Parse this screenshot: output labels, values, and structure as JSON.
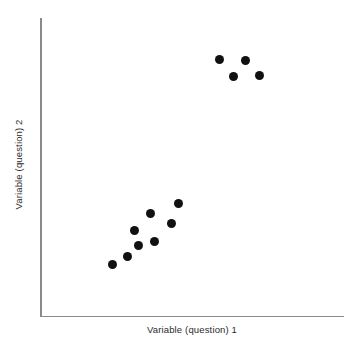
{
  "chart_data": {
    "type": "scatter",
    "title": "",
    "subtitle": "",
    "xlabel": "Variable (question) 1",
    "ylabel": "Variable (question) 2",
    "xlim": [
      0,
      100
    ],
    "ylim": [
      0,
      100
    ],
    "grid": false,
    "legend": null,
    "tick_labels": {
      "x": [],
      "y": []
    },
    "marker": {
      "shape": "circle",
      "color": "#111111",
      "size_px": 9
    },
    "annotations": [],
    "points_px": [
      {
        "x": 219,
        "y": 59
      },
      {
        "x": 245,
        "y": 60
      },
      {
        "x": 233,
        "y": 76
      },
      {
        "x": 259,
        "y": 75
      },
      {
        "x": 178,
        "y": 203
      },
      {
        "x": 150,
        "y": 213
      },
      {
        "x": 171,
        "y": 223
      },
      {
        "x": 134,
        "y": 230
      },
      {
        "x": 154,
        "y": 241
      },
      {
        "x": 138,
        "y": 245
      },
      {
        "x": 127,
        "y": 256
      },
      {
        "x": 112,
        "y": 264
      }
    ],
    "points": [
      {
        "x": 59.1,
        "y": 86.2
      },
      {
        "x": 67.7,
        "y": 85.9
      },
      {
        "x": 63.7,
        "y": 80.5
      },
      {
        "x": 72.3,
        "y": 80.9
      },
      {
        "x": 45.5,
        "y": 37.9
      },
      {
        "x": 36.3,
        "y": 34.6
      },
      {
        "x": 43.2,
        "y": 31.2
      },
      {
        "x": 31.0,
        "y": 28.9
      },
      {
        "x": 37.6,
        "y": 25.2
      },
      {
        "x": 32.3,
        "y": 23.8
      },
      {
        "x": 28.7,
        "y": 20.1
      },
      {
        "x": 23.8,
        "y": 17.4
      }
    ],
    "clusters": [
      {
        "name": "upper-right cluster",
        "count": 4
      },
      {
        "name": "lower-left cluster",
        "count": 8
      }
    ],
    "n_points": 12,
    "axis_color": "#8a8a8a",
    "background_color": "#ffffff"
  },
  "axes": {
    "x_label": "Variable (question) 1",
    "y_label": "Variable (question) 2"
  }
}
